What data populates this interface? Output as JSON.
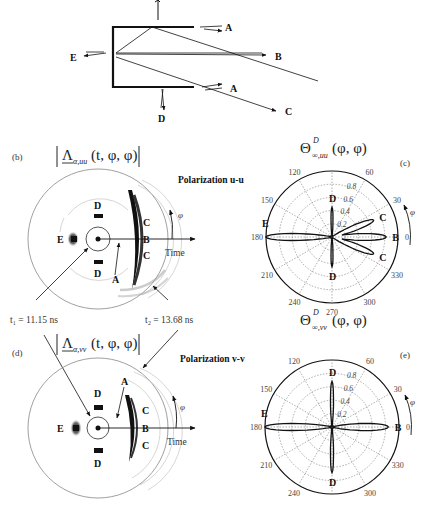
{
  "diagram": {
    "labels": {
      "A_top": "A",
      "A_bottom": "A",
      "B": "B",
      "C": "C",
      "D": "D",
      "E": "E"
    }
  },
  "panel_b": {
    "tag": "(b)",
    "formula_main": "Λ",
    "formula_sub": "α,uu",
    "formula_args": "(t, φ, φ)",
    "polarization": "Polarization u-u",
    "time_label": "Time",
    "phi_label": "φ",
    "labels": {
      "A": "A",
      "B": "B",
      "C1": "C",
      "C2": "C",
      "D1": "D",
      "D2": "D",
      "E": "E"
    }
  },
  "panel_d": {
    "tag": "(d)",
    "formula_main": "Λ",
    "formula_sub": "α,vv",
    "formula_args": "(t, φ, φ)",
    "polarization": "Polarization v-v",
    "time_label": "Time",
    "phi_label": "φ",
    "labels": {
      "A": "A",
      "B": "B",
      "C1": "C",
      "C2": "C",
      "D1": "D",
      "D2": "D",
      "E": "E"
    }
  },
  "times": {
    "t1": "t₁ = 11.15 ns",
    "t2": "t₂ = 13.68 ns"
  },
  "panel_c": {
    "tag": "(c)",
    "formula_main": "Θ",
    "formula_sup": "D",
    "formula_sub": "∞,uu",
    "formula_args": "(φ, φ)",
    "phi_label": "φ"
  },
  "panel_e": {
    "tag": "(e)",
    "formula_main": "Θ",
    "formula_sup": "D",
    "formula_sub": "∞,vv",
    "formula_args": "(φ, φ)",
    "phi_label": "φ"
  },
  "chart_data": [
    {
      "type": "polar",
      "title": "Θ^D_∞,uu(φ,φ) — Polarization u-u (c)",
      "angle_ticks": [
        0,
        30,
        60,
        90,
        120,
        150,
        180,
        210,
        240,
        270,
        300,
        330
      ],
      "angle_tick_labels": [
        "0",
        "30",
        "60",
        "",
        "120",
        "150",
        "180",
        "210",
        "240",
        "270",
        "300",
        "330"
      ],
      "radial_ticks": [
        0.2,
        0.4,
        0.6,
        0.8
      ],
      "rlim": [
        0,
        1.0
      ],
      "grid": true,
      "lobes": [
        {
          "label": "B",
          "angle_deg": 0,
          "r": 0.82
        },
        {
          "label": "C",
          "angle_deg": 22,
          "r": 0.68
        },
        {
          "label": "C",
          "angle_deg": -22,
          "r": 0.68
        },
        {
          "label": "D",
          "angle_deg": 90,
          "r": 0.45
        },
        {
          "label": "D",
          "angle_deg": 270,
          "r": 0.45
        },
        {
          "label": "E",
          "angle_deg": 180,
          "r": 1.0
        }
      ]
    },
    {
      "type": "polar",
      "title": "Θ^D_∞,vv(φ,φ) — Polarization v-v (e)",
      "angle_ticks": [
        0,
        30,
        60,
        90,
        120,
        150,
        180,
        210,
        240,
        270,
        300,
        330
      ],
      "angle_tick_labels": [
        "0",
        "30",
        "60",
        "",
        "120",
        "150",
        "180",
        "210",
        "240",
        "",
        "300",
        "330"
      ],
      "radial_ticks": [
        0.2,
        0.4,
        0.6,
        0.8
      ],
      "rlim": [
        0,
        1.0
      ],
      "grid": true,
      "lobes": [
        {
          "label": "B",
          "angle_deg": 0,
          "r": 0.84
        },
        {
          "label": "D",
          "angle_deg": 90,
          "r": 0.68
        },
        {
          "label": "D",
          "angle_deg": 270,
          "r": 0.68
        },
        {
          "label": "E",
          "angle_deg": 180,
          "r": 1.0
        }
      ]
    }
  ]
}
